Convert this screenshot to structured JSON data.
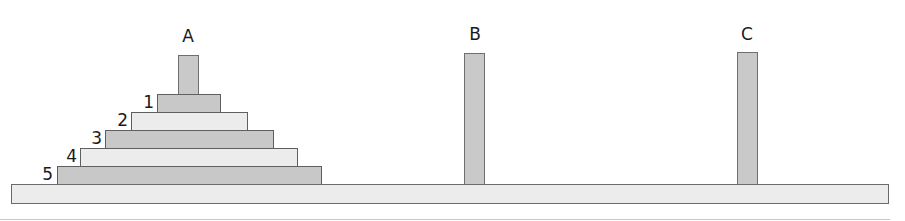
{
  "diagram": {
    "title_context": "Tower of Hanoi",
    "pegs": [
      {
        "id": "A",
        "label": "A"
      },
      {
        "id": "B",
        "label": "B"
      },
      {
        "id": "C",
        "label": "C"
      }
    ],
    "disks": [
      {
        "number": "1",
        "peg": "A",
        "shade": "dark"
      },
      {
        "number": "2",
        "peg": "A",
        "shade": "light"
      },
      {
        "number": "3",
        "peg": "A",
        "shade": "dark"
      },
      {
        "number": "4",
        "peg": "A",
        "shade": "light"
      },
      {
        "number": "5",
        "peg": "A",
        "shade": "dark"
      }
    ],
    "colors": {
      "dark_fill": "#c8c8c8",
      "light_fill": "#ececec",
      "outline": "#5f5f5f"
    }
  }
}
